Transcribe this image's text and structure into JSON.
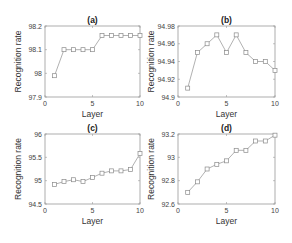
{
  "chart_data": [
    {
      "type": "line",
      "title": "(a)",
      "xlabel": "Layer",
      "ylabel": "Recognition rate",
      "x": [
        1,
        2,
        3,
        4,
        5,
        6,
        7,
        8,
        9,
        10
      ],
      "values": [
        97.99,
        98.1,
        98.1,
        98.1,
        98.1,
        98.16,
        98.16,
        98.16,
        98.16,
        98.16
      ],
      "xlim": [
        0,
        10
      ],
      "ylim": [
        97.9,
        98.2
      ],
      "xticks": [
        0,
        5,
        10
      ],
      "yticks": [
        97.9,
        98,
        98.1,
        98.2
      ],
      "ytick_labels": [
        "97.9",
        "98",
        "98.1",
        "98.2"
      ],
      "marker": "square",
      "grid": false,
      "box": [
        45,
        26,
        140,
        97
      ]
    },
    {
      "type": "line",
      "title": "(b)",
      "xlabel": "Layer",
      "ylabel": "Recognition rate",
      "x": [
        1,
        2,
        3,
        4,
        5,
        6,
        7,
        8,
        9,
        10
      ],
      "values": [
        94.91,
        94.95,
        94.96,
        94.97,
        94.95,
        94.97,
        94.95,
        94.94,
        94.94,
        94.93
      ],
      "xlim": [
        0,
        10
      ],
      "ylim": [
        94.9,
        94.98
      ],
      "xticks": [
        0,
        5,
        10
      ],
      "yticks": [
        94.9,
        94.92,
        94.94,
        94.96,
        94.98
      ],
      "ytick_labels": [
        "94.9",
        "94.92",
        "94.94",
        "94.96",
        "94.98"
      ],
      "marker": "square",
      "grid": false,
      "box": [
        178,
        26,
        275,
        97
      ]
    },
    {
      "type": "line",
      "title": "(c)",
      "xlabel": "Layer",
      "ylabel": "Recognition rate",
      "x": [
        1,
        2,
        3,
        4,
        5,
        6,
        7,
        8,
        9,
        10
      ],
      "values": [
        94.92,
        94.98,
        95.02,
        94.98,
        95.07,
        95.16,
        95.21,
        95.21,
        95.24,
        95.58
      ],
      "xlim": [
        0,
        10
      ],
      "ylim": [
        94.5,
        96
      ],
      "xticks": [
        0,
        5,
        10
      ],
      "yticks": [
        94.5,
        95,
        95.5,
        96
      ],
      "ytick_labels": [
        "94.5",
        "95",
        "95.5",
        "96"
      ],
      "marker": "square",
      "grid": false,
      "box": [
        45,
        134,
        140,
        204
      ]
    },
    {
      "type": "line",
      "title": "(d)",
      "xlabel": "Layer",
      "ylabel": "Recognition rate",
      "x": [
        1,
        2,
        3,
        4,
        5,
        6,
        7,
        8,
        9,
        10
      ],
      "values": [
        92.7,
        92.79,
        92.9,
        92.94,
        92.97,
        93.06,
        93.06,
        93.14,
        93.14,
        93.19
      ],
      "xlim": [
        0,
        10
      ],
      "ylim": [
        92.6,
        93.2
      ],
      "xticks": [
        0,
        5,
        10
      ],
      "yticks": [
        92.6,
        92.8,
        93,
        93.2
      ],
      "ytick_labels": [
        "92.6",
        "92.8",
        "93",
        "93.2"
      ],
      "marker": "square",
      "grid": false,
      "box": [
        178,
        134,
        275,
        204
      ]
    }
  ],
  "colors": {
    "line": "#a8a8a8",
    "marker": "#8a8a8a",
    "axis": "#9a9a9a"
  }
}
